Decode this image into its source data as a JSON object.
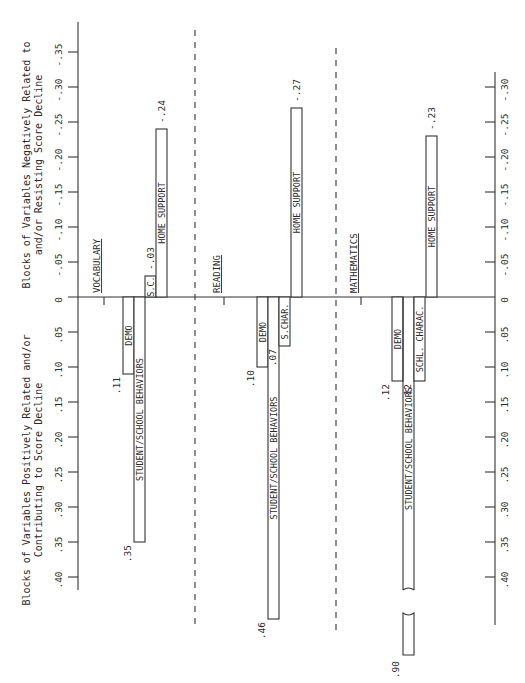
{
  "chart_data": {
    "type": "bar",
    "orientation": "rotated-diverging",
    "titles": {
      "negative_side": [
        "Blocks of Variables Negatively Related to",
        "and/or Resisting Score Decline"
      ],
      "positive_side": [
        "Blocks of Variables Positively Related and/or",
        "Contributing to Score Decline"
      ]
    },
    "axes": [
      {
        "name": "left-axis",
        "range": [
          -0.35,
          0.4
        ],
        "ticks": [
          {
            "v": -0.35,
            "label": "-.35"
          },
          {
            "v": -0.3,
            "label": "-.30"
          },
          {
            "v": -0.25,
            "label": "-.25"
          },
          {
            "v": -0.2,
            "label": "-.20"
          },
          {
            "v": -0.15,
            "label": "-.15"
          },
          {
            "v": -0.1,
            "label": "-.10"
          },
          {
            "v": -0.05,
            "label": "-.05"
          },
          {
            "v": 0,
            "label": "0"
          },
          {
            "v": 0.05,
            "label": ".05"
          },
          {
            "v": 0.1,
            "label": ".10"
          },
          {
            "v": 0.15,
            "label": ".15"
          },
          {
            "v": 0.2,
            "label": ".20"
          },
          {
            "v": 0.25,
            "label": ".25"
          },
          {
            "v": 0.3,
            "label": ".30"
          },
          {
            "v": 0.35,
            "label": ".35"
          },
          {
            "v": 0.4,
            "label": ".40"
          }
        ]
      },
      {
        "name": "right-axis",
        "range": [
          -0.3,
          0.4
        ],
        "ticks": [
          {
            "v": -0.3,
            "label": "-.30"
          },
          {
            "v": -0.25,
            "label": "-.25"
          },
          {
            "v": -0.2,
            "label": "-.20"
          },
          {
            "v": -0.15,
            "label": "-.15"
          },
          {
            "v": -0.1,
            "label": "-.10"
          },
          {
            "v": -0.05,
            "label": "-.05"
          },
          {
            "v": 0,
            "label": "0"
          },
          {
            "v": 0.05,
            "label": ".05"
          },
          {
            "v": 0.1,
            "label": ".10"
          },
          {
            "v": 0.15,
            "label": ".15"
          },
          {
            "v": 0.2,
            "label": ".20"
          },
          {
            "v": 0.25,
            "label": ".25"
          },
          {
            "v": 0.3,
            "label": ".30"
          },
          {
            "v": 0.35,
            "label": ".35"
          },
          {
            "v": 0.4,
            "label": ".40"
          }
        ]
      }
    ],
    "groups": [
      {
        "name": "VOCABULARY",
        "bars": [
          {
            "label": "DEMO",
            "value": 0.11,
            "value_label": ".11"
          },
          {
            "label": "STUDENT/SCHOOL BEHAVIORS",
            "value": 0.35,
            "value_label": ".35"
          },
          {
            "label": "S.C.",
            "value": -0.03,
            "value_label": "-.03"
          },
          {
            "label": "HOME SUPPORT",
            "value": -0.24,
            "value_label": "-.24"
          }
        ]
      },
      {
        "name": "READING",
        "bars": [
          {
            "label": "DEMO",
            "value": 0.1,
            "value_label": ".10"
          },
          {
            "label": "STUDENT/SCHOOL BEHAVIORS",
            "value": 0.46,
            "value_label": ".46"
          },
          {
            "label": "S.CHAR.",
            "value": 0.07,
            "value_label": ".07"
          },
          {
            "label": "HOME SUPPORT",
            "value": -0.27,
            "value_label": "-.27"
          }
        ]
      },
      {
        "name": "MATHEMATICS",
        "bars": [
          {
            "label": "DEMO",
            "value": 0.12,
            "value_label": ".12"
          },
          {
            "label": "STUDENT/SCHOOL BEHAVIORS",
            "value": 0.9,
            "value_label": ".90",
            "broken": true
          },
          {
            "label": "SCHL. CHARAC.",
            "value": 0.12,
            "value_label": ".12"
          },
          {
            "label": "HOME SUPPORT",
            "value": -0.23,
            "value_label": "-.23"
          }
        ]
      }
    ],
    "xlabel": "",
    "ylabel": ""
  }
}
